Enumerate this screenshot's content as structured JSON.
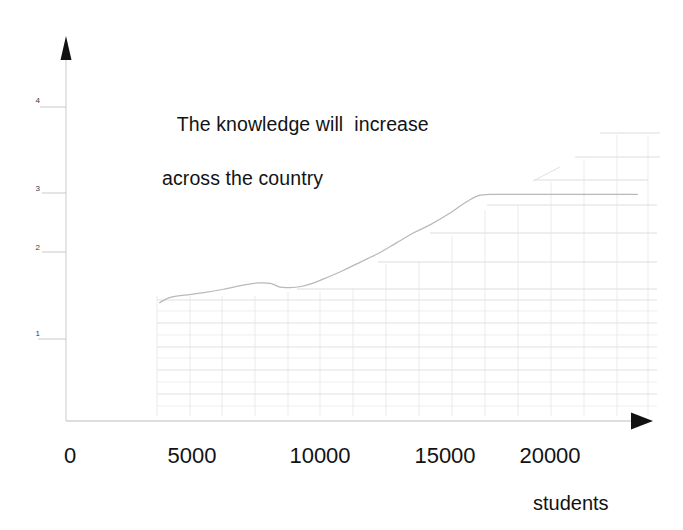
{
  "chart_data": {
    "type": "line",
    "title": "The knowledge will  increase across the country",
    "title_lines": [
      "The knowledge will  increase",
      "across the country"
    ],
    "xlabel": "students",
    "ylabel": "",
    "xlim": [
      0,
      24000
    ],
    "ylim": [
      0,
      4.35
    ],
    "grid": true,
    "legend": "none",
    "x_ticks": [
      {
        "value": 0,
        "label": "0"
      },
      {
        "value": 5000,
        "label": "5000"
      },
      {
        "value": 10000,
        "label": "10000"
      },
      {
        "value": 15000,
        "label": "15000"
      },
      {
        "value": 20000,
        "label": "20000"
      }
    ],
    "y_ticks": [
      {
        "value": 1,
        "label": "1"
      },
      {
        "value": 2,
        "label": "2"
      },
      {
        "value": 3,
        "label": "3"
      },
      {
        "value": 4,
        "label": "4"
      }
    ],
    "series": [
      {
        "name": "knowledge",
        "color": "#b9b9b9",
        "x": [
          3800,
          4200,
          4800,
          5600,
          6400,
          7200,
          7800,
          8300,
          8700,
          9100,
          9500,
          10000,
          10600,
          11300,
          12000,
          12700,
          13400,
          14100,
          14800,
          15500,
          16200,
          16700,
          17200,
          19000,
          21000,
          23200
        ],
        "y": [
          1.41,
          1.47,
          1.5,
          1.53,
          1.57,
          1.62,
          1.645,
          1.64,
          1.595,
          1.59,
          1.6,
          1.64,
          1.71,
          1.8,
          1.9,
          2.0,
          2.12,
          2.24,
          2.34,
          2.46,
          2.6,
          2.68,
          2.7,
          2.7,
          2.7,
          2.7
        ]
      }
    ],
    "gridlines_y": [
      0.55,
      0.78,
      1.0,
      1.22,
      1.44,
      1.7,
      2.0,
      2.3,
      2.7,
      3.1,
      3.35,
      3.62
    ],
    "annotations": []
  },
  "axes": {
    "y_arrow": "up-arrow",
    "x_arrow": "right-arrow",
    "axis_color": "#1a1a1a"
  },
  "colors": {
    "background": "#ffffff",
    "text": "#121212",
    "curve": "#b9b9b9",
    "grid": "#d8d8d8",
    "axis": "#1a1a1a"
  }
}
